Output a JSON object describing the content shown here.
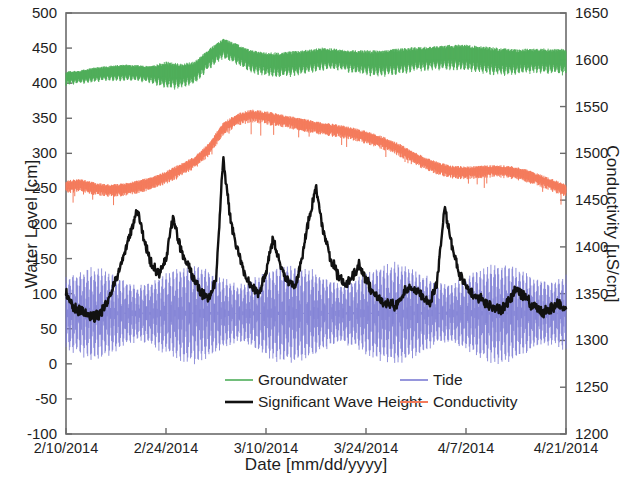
{
  "chart_data": {
    "type": "line",
    "title": "",
    "xlabel": "Date [mm/dd/yyyy]",
    "ylabel": "Water Level [cm]",
    "y2label": "Conductivity [µS/cm]",
    "xlim": [
      "2/10/2014",
      "4/21/2014"
    ],
    "ylim": [
      -100,
      500
    ],
    "y2lim": [
      1200,
      1650
    ],
    "ytick_step": 50,
    "y2tick_step": 50,
    "grid": false,
    "legend_position": "bottom-center",
    "xticks": [
      "2/10/2014",
      "2/24/2014",
      "3/10/2014",
      "3/24/2014",
      "4/7/2014",
      "4/21/2014"
    ],
    "yticks": [
      500,
      450,
      400,
      350,
      300,
      250,
      200,
      150,
      100,
      50,
      0,
      -50,
      -100
    ],
    "y2ticks": [
      1650,
      1600,
      1550,
      1500,
      1450,
      1400,
      1350,
      1300,
      1250,
      1200
    ],
    "series": [
      {
        "name": "Groundwater",
        "color": "#4FAE5A",
        "axis": "left",
        "units": "cm",
        "note": "high-frequency tidal oscillation riding on slow trend",
        "osc_amplitude": [
          11,
          11,
          12,
          12,
          13,
          13,
          14,
          22,
          20,
          18,
          16,
          16,
          17,
          18,
          19,
          20,
          20,
          19,
          18,
          17,
          18,
          20,
          21,
          21,
          20,
          19,
          19,
          20,
          21,
          22,
          22,
          21,
          20,
          20,
          20,
          21
        ],
        "x": [
          "2/10",
          "2/12",
          "2/14",
          "2/16",
          "2/18",
          "2/20",
          "2/22",
          "2/24",
          "2/26",
          "2/28",
          "3/2",
          "3/4",
          "3/6",
          "3/8",
          "3/10",
          "3/12",
          "3/14",
          "3/16",
          "3/18",
          "3/20",
          "3/22",
          "3/24",
          "3/26",
          "3/28",
          "3/30",
          "4/1",
          "4/3",
          "4/5",
          "4/7",
          "4/9",
          "4/11",
          "4/13",
          "4/15",
          "4/17",
          "4/19",
          "4/21"
        ],
        "values": [
          405,
          407,
          410,
          412,
          413,
          412,
          410,
          408,
          407,
          412,
          432,
          447,
          438,
          428,
          424,
          423,
          425,
          428,
          432,
          431,
          428,
          426,
          425,
          427,
          430,
          432,
          433,
          434,
          433,
          430,
          428,
          427,
          428,
          429,
          428,
          427
        ]
      },
      {
        "name": "Tide",
        "color": "#7C7CD4",
        "axis": "left",
        "units": "cm",
        "note": "semidiurnal tide with spring-neap envelope modulation",
        "mean_level": 72,
        "envelope_max": [
          55,
          62,
          68,
          62,
          50,
          40,
          48,
          60,
          70,
          73,
          66,
          52,
          42,
          50,
          63,
          72,
          74,
          68,
          55,
          44,
          48,
          60,
          70,
          74,
          70,
          58,
          46,
          44,
          54,
          66,
          73,
          72,
          62,
          50,
          46,
          56
        ],
        "x": [
          "2/10",
          "2/12",
          "2/14",
          "2/16",
          "2/18",
          "2/20",
          "2/22",
          "2/24",
          "2/26",
          "2/28",
          "3/2",
          "3/4",
          "3/6",
          "3/8",
          "3/10",
          "3/12",
          "3/14",
          "3/16",
          "3/18",
          "3/20",
          "3/22",
          "3/24",
          "3/26",
          "3/28",
          "3/30",
          "4/1",
          "4/3",
          "4/5",
          "4/7",
          "4/9",
          "4/11",
          "4/13",
          "4/15",
          "4/17",
          "4/19",
          "4/21"
        ],
        "values": [
          72,
          72,
          72,
          72,
          72,
          72,
          72,
          72,
          72,
          72,
          72,
          72,
          72,
          72,
          72,
          72,
          72,
          72,
          72,
          72,
          72,
          72,
          72,
          72,
          72,
          72,
          72,
          72,
          72,
          72,
          72,
          72,
          72,
          72,
          72,
          72
        ]
      },
      {
        "name": "Significant Wave Height",
        "color": "#111111",
        "axis": "left",
        "units": "cm",
        "note": "storm-event peaks; largest event near 3/4/2014",
        "x": [
          "2/10",
          "2/11",
          "2/12",
          "2/13",
          "2/14",
          "2/15",
          "2/16",
          "2/17",
          "2/18",
          "2/19",
          "2/20",
          "2/21",
          "2/22",
          "2/23",
          "2/24",
          "2/25",
          "2/26",
          "2/27",
          "2/28",
          "3/1",
          "3/2",
          "3/3",
          "3/4",
          "3/5",
          "3/6",
          "3/7",
          "3/8",
          "3/9",
          "3/10",
          "3/11",
          "3/12",
          "3/13",
          "3/14",
          "3/15",
          "3/16",
          "3/17",
          "3/18",
          "3/19",
          "3/20",
          "3/21",
          "3/22",
          "3/23",
          "3/24",
          "3/25",
          "3/26",
          "3/27",
          "3/28",
          "3/29",
          "3/30",
          "3/31",
          "4/1",
          "4/2",
          "4/3",
          "4/4",
          "4/5",
          "4/6",
          "4/7",
          "4/8",
          "4/9",
          "4/10",
          "4/11",
          "4/12",
          "4/13",
          "4/14",
          "4/15",
          "4/16",
          "4/17",
          "4/18",
          "4/19",
          "4/20",
          "4/21"
        ],
        "values": [
          100,
          82,
          76,
          70,
          66,
          74,
          95,
          120,
          150,
          185,
          220,
          175,
          140,
          128,
          150,
          212,
          165,
          140,
          120,
          100,
          92,
          120,
          295,
          205,
          160,
          128,
          110,
          100,
          130,
          180,
          140,
          118,
          108,
          150,
          205,
          252,
          190,
          150,
          128,
          115,
          122,
          140,
          120,
          102,
          90,
          86,
          82,
          95,
          110,
          105,
          95,
          88,
          120,
          222,
          170,
          130,
          110,
          100,
          92,
          86,
          80,
          78,
          90,
          105,
          98,
          86,
          78,
          74,
          80,
          85,
          80
        ]
      },
      {
        "name": "Conductivity",
        "color": "#F47B5C",
        "axis": "right",
        "units": "µS/cm",
        "note": "plotted on right axis; values below given in right-axis µS/cm units",
        "x": [
          "2/10",
          "2/12",
          "2/14",
          "2/16",
          "2/18",
          "2/20",
          "2/22",
          "2/24",
          "2/26",
          "2/28",
          "3/2",
          "3/4",
          "3/6",
          "3/8",
          "3/10",
          "3/12",
          "3/14",
          "3/16",
          "3/18",
          "3/20",
          "3/22",
          "3/24",
          "3/26",
          "3/28",
          "3/30",
          "4/1",
          "4/3",
          "4/5",
          "4/7",
          "4/9",
          "4/11",
          "4/13",
          "4/15",
          "4/17",
          "4/19",
          "4/21"
        ],
        "values": [
          1466,
          1468,
          1464,
          1462,
          1463,
          1466,
          1470,
          1476,
          1484,
          1492,
          1506,
          1528,
          1538,
          1542,
          1540,
          1537,
          1534,
          1531,
          1528,
          1526,
          1523,
          1519,
          1514,
          1508,
          1500,
          1492,
          1486,
          1482,
          1481,
          1482,
          1483,
          1482,
          1479,
          1474,
          1468,
          1462
        ],
        "values_left_axis_cm": [
          255,
          257,
          252,
          250,
          251,
          255,
          260,
          268,
          278,
          289,
          308,
          337,
          350,
          356,
          353,
          349,
          345,
          341,
          337,
          335,
          331,
          326,
          319,
          311,
          300,
          289,
          281,
          276,
          275,
          276,
          277,
          276,
          272,
          265,
          257,
          249
        ]
      }
    ],
    "legend": [
      {
        "label": "Groundwater",
        "color": "#4FAE5A",
        "width": 1.6
      },
      {
        "label": "Tide",
        "color": "#7C7CD4",
        "width": 1.6
      },
      {
        "label": "Significant Wave Height",
        "color": "#111111",
        "width": 2.6
      },
      {
        "label": "Conductivity",
        "color": "#F47B5C",
        "width": 2.0
      }
    ]
  },
  "axes": {
    "left": {
      "title": "Water Level [cm]"
    },
    "right": {
      "title": "Conductivity [µS/cm]"
    },
    "bottom": {
      "title": "Date [mm/dd/yyyy]"
    }
  }
}
